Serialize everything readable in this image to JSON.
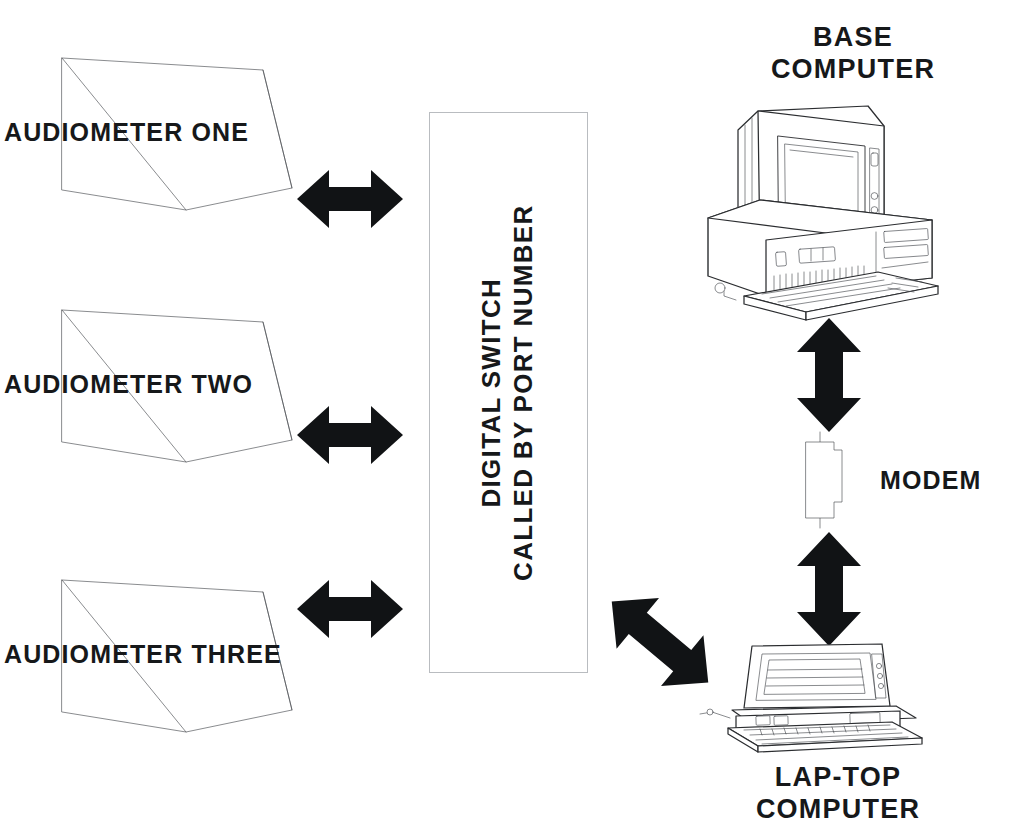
{
  "diagram": {
    "background_color": "#ffffff",
    "ink_color": "#16181a",
    "arrow_color": "#111315",
    "box_border_color": "#b9bcc0"
  },
  "devices": {
    "audiometers": [
      {
        "label": "AUDIOMETER ONE",
        "icon": "audiometer-icon"
      },
      {
        "label": "AUDIOMETER TWO",
        "icon": "audiometer-icon"
      },
      {
        "label": "AUDIOMETER THREE",
        "icon": "audiometer-icon"
      }
    ],
    "switch": {
      "line1": "DIGITAL SWITCH",
      "line2": "CALLED BY PORT NUMBER",
      "icon": "switch-box-icon"
    },
    "base_computer": {
      "line1": "BASE",
      "line2": "COMPUTER",
      "icon": "desktop-computer-icon"
    },
    "modem": {
      "label": "MODEM",
      "icon": "modem-icon"
    },
    "laptop": {
      "line1": "LAP-TOP",
      "line2": "COMPUTER",
      "icon": "laptop-computer-icon"
    }
  },
  "connections": [
    {
      "name": "audiometer-one-to-switch",
      "icon": "double-arrow-horizontal-icon"
    },
    {
      "name": "audiometer-two-to-switch",
      "icon": "double-arrow-horizontal-icon"
    },
    {
      "name": "audiometer-three-to-switch",
      "icon": "double-arrow-horizontal-icon"
    },
    {
      "name": "switch-to-laptop",
      "icon": "double-arrow-diagonal-icon"
    },
    {
      "name": "base-computer-to-modem",
      "icon": "double-arrow-vertical-icon"
    },
    {
      "name": "modem-to-laptop",
      "icon": "double-arrow-vertical-icon"
    }
  ]
}
